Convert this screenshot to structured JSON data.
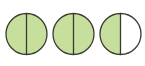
{
  "figure": {
    "title": "Fraction circles: 2 and 1/2 halves shaded",
    "fill_color": "#c6df9c",
    "empty_color": "#ffffff",
    "stroke_color": "#3b3b33",
    "circles": [
      {
        "id": "circle-1",
        "cx": 26.5,
        "cy": 34,
        "r": 20.5,
        "parts": 2,
        "shaded": 2
      },
      {
        "id": "circle-2",
        "cx": 73.5,
        "cy": 34,
        "r": 20.5,
        "parts": 2,
        "shaded": 2
      },
      {
        "id": "circle-3",
        "cx": 120.5,
        "cy": 34,
        "r": 20.5,
        "parts": 2,
        "shaded": 1
      }
    ]
  }
}
